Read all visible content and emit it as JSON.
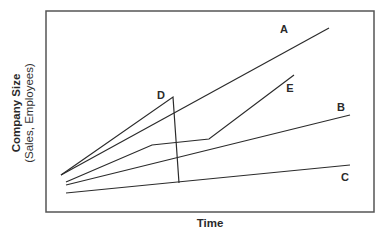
{
  "diagram": {
    "axes": {
      "y_label_main": "Company Size",
      "y_label_sub": "(Sales, Employees)",
      "x_label": "Time"
    },
    "colors": {
      "line": "#2b2b2b",
      "frame": "#555555",
      "background": "#ffffff"
    },
    "series": [
      {
        "id": "A",
        "label": "A",
        "points": [
          [
            61,
            175
          ],
          [
            329,
            28
          ]
        ],
        "label_pos": [
          284,
          29
        ]
      },
      {
        "id": "B",
        "label": "B",
        "points": [
          [
            66,
            185
          ],
          [
            350,
            115
          ]
        ],
        "label_pos": [
          341,
          107
        ]
      },
      {
        "id": "C",
        "label": "C",
        "points": [
          [
            66,
            193
          ],
          [
            350,
            165
          ]
        ],
        "label_pos": [
          345,
          177
        ]
      },
      {
        "id": "D",
        "label": "D",
        "points": [
          [
            61,
            175
          ],
          [
            173,
            97
          ],
          [
            179,
            183
          ]
        ],
        "label_pos": [
          161,
          95
        ]
      },
      {
        "id": "E",
        "label": "E",
        "points": [
          [
            66,
            182
          ],
          [
            152,
            145
          ],
          [
            209,
            139
          ],
          [
            294,
            75
          ]
        ],
        "label_pos": [
          290,
          88
        ]
      }
    ]
  }
}
